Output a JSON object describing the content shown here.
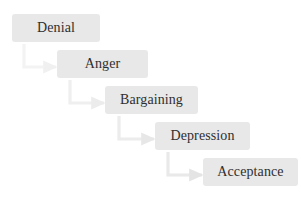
{
  "diagram": {
    "type": "cascading-flowchart",
    "background_color": "#ffffff",
    "node_fill_color": "#e8e8e8",
    "node_text_color": "#2f2f2f",
    "connector_color": "#e6e6e6",
    "canvas": {
      "width": 301,
      "height": 200
    },
    "nodes": [
      {
        "id": "denial",
        "label": "Denial",
        "x": 12,
        "y": 14,
        "width": 88,
        "height": 28
      },
      {
        "id": "anger",
        "label": "Anger",
        "x": 57,
        "y": 50,
        "width": 91,
        "height": 28
      },
      {
        "id": "bargaining",
        "label": "Bargaining",
        "x": 105,
        "y": 86,
        "width": 93,
        "height": 28
      },
      {
        "id": "depression",
        "label": "Depression",
        "x": 155,
        "y": 122,
        "width": 95,
        "height": 28
      },
      {
        "id": "acceptance",
        "label": "Acceptance",
        "x": 203,
        "y": 158,
        "width": 95,
        "height": 28
      }
    ],
    "connectors": [
      {
        "id": "denial-to-anger",
        "from": "denial",
        "to": "anger",
        "shape": "elbow-down-right",
        "start_x": 24,
        "start_y": 44,
        "corner_y": 67,
        "end_x": 56,
        "opacity": 0.45
      },
      {
        "id": "anger-to-bargaining",
        "from": "anger",
        "to": "bargaining",
        "shape": "elbow-down-right",
        "start_x": 70,
        "start_y": 80,
        "corner_y": 103,
        "end_x": 104,
        "opacity": 0.6
      },
      {
        "id": "bargaining-to-depression",
        "from": "bargaining",
        "to": "depression",
        "shape": "elbow-down-right",
        "start_x": 119,
        "start_y": 116,
        "corner_y": 139,
        "end_x": 154,
        "opacity": 0.75
      },
      {
        "id": "depression-to-acceptance",
        "from": "depression",
        "to": "acceptance",
        "shape": "elbow-down-right",
        "start_x": 168,
        "start_y": 152,
        "corner_y": 175,
        "end_x": 202,
        "opacity": 0.85
      }
    ]
  }
}
